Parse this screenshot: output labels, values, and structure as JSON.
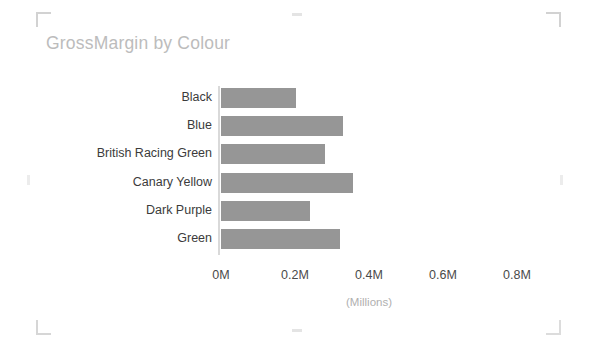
{
  "chart_data": {
    "type": "bar",
    "orientation": "horizontal",
    "title": "GrossMargin by Colour",
    "xlabel": "(Millions)",
    "ylabel": "",
    "categories": [
      "Black",
      "Blue",
      "British Racing Green",
      "Canary Yellow",
      "Dark Purple",
      "Green"
    ],
    "values": [
      0.203,
      0.33,
      0.281,
      0.357,
      0.241,
      0.322
    ],
    "value_unit": "Millions",
    "xlim": [
      0,
      0.9
    ],
    "xticks": [
      0,
      0.2,
      0.4,
      0.6,
      0.8
    ],
    "xtick_labels": [
      "0M",
      "0.2M",
      "0.4M",
      "0.6M",
      "0.8M"
    ],
    "grid": false,
    "legend": null,
    "series": [
      {
        "name": "GrossMargin",
        "values": [
          0.203,
          0.33,
          0.281,
          0.357,
          0.241,
          0.322
        ]
      }
    ],
    "bar_color": "#969696"
  },
  "visual": {
    "title": "GrossMargin by Colour",
    "title_color": "#bcbcbc",
    "axis_units_label": "(Millions)",
    "axis_line_color": "#d9d9d9",
    "selection_frame_color": "#d2d2d2"
  },
  "categories": [
    {
      "label": "Black",
      "value": 0.203,
      "bar_px": 75
    },
    {
      "label": "Blue",
      "value": 0.33,
      "bar_px": 122
    },
    {
      "label": "British Racing Green",
      "value": 0.281,
      "bar_px": 104
    },
    {
      "label": "Canary Yellow",
      "value": 0.357,
      "bar_px": 132
    },
    {
      "label": "Dark Purple",
      "value": 0.241,
      "bar_px": 89
    },
    {
      "label": "Green",
      "value": 0.322,
      "bar_px": 119
    }
  ],
  "xticks": [
    {
      "label": "0M",
      "x_px": 221
    },
    {
      "label": "0.2M",
      "x_px": 295
    },
    {
      "label": "0.4M",
      "x_px": 369
    },
    {
      "label": "0.6M",
      "x_px": 443
    },
    {
      "label": "0.8M",
      "x_px": 517
    }
  ]
}
